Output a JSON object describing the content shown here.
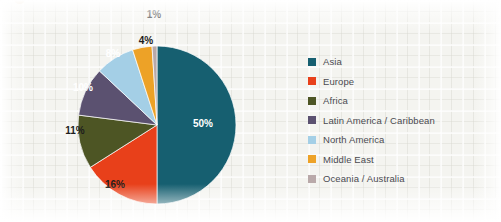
{
  "chart_data": {
    "type": "pie",
    "title": "",
    "subtitle": "",
    "xlabel": "",
    "ylabel": "",
    "legend_position": "right",
    "grid": false,
    "start_angle_deg": 0,
    "direction": "clockwise",
    "categories": [
      "Asia",
      "Europe",
      "Africa",
      "Latin America / Caribbean",
      "North America",
      "Middle East",
      "Oceania / Australia"
    ],
    "values": [
      50,
      16,
      11,
      10,
      8,
      4,
      1
    ],
    "value_unit": "%",
    "colors": [
      "#165f70",
      "#e8401a",
      "#4d5524",
      "#5b5170",
      "#a4cfe6",
      "#eda227",
      "#b9a9a9"
    ],
    "slices": [
      {
        "label": "Asia",
        "value": 50,
        "display": "50%",
        "color": "#165f70",
        "label_color": "#ffffff",
        "label_x": 203,
        "label_y": 127
      },
      {
        "label": "Europe",
        "value": 16,
        "display": "16%",
        "color": "#e8401a",
        "label_color": "#1d1d1d",
        "label_x": 115,
        "label_y": 188
      },
      {
        "label": "Africa",
        "value": 11,
        "display": "11%",
        "color": "#4d5524",
        "label_color": "#1d1d1d",
        "label_x": 75,
        "label_y": 134
      },
      {
        "label": "Latin America / Caribbean",
        "value": 10,
        "display": "10%",
        "color": "#5b5170",
        "label_color": "#ffffff",
        "label_x": 83,
        "label_y": 91
      },
      {
        "label": "North America",
        "value": 8,
        "display": "8%",
        "color": "#a4cfe6",
        "label_color": "#ffffff",
        "label_x": 113,
        "label_y": 57
      },
      {
        "label": "Middle East",
        "value": 4,
        "display": "4%",
        "color": "#eda227",
        "label_color": "#1d1d1d",
        "label_x": 146,
        "label_y": 44
      },
      {
        "label": "Oceania / Australia",
        "value": 1,
        "display": "1%",
        "color": "#b9a9a9",
        "label_color": "#1d1d1d",
        "label_x": 154,
        "label_y": 18
      }
    ],
    "geometry": {
      "center_x": 157,
      "center_y": 125,
      "radius": 79
    }
  },
  "legend": {
    "items": [
      {
        "label": "Asia",
        "color": "#165f70"
      },
      {
        "label": "Europe",
        "color": "#e8401a"
      },
      {
        "label": "Africa",
        "color": "#4d5524"
      },
      {
        "label": "Latin America / Caribbean",
        "color": "#5b5170"
      },
      {
        "label": "North America",
        "color": "#a4cfe6"
      },
      {
        "label": "Middle East",
        "color": "#eda227"
      },
      {
        "label": "Oceania / Australia",
        "color": "#b9a9a9"
      }
    ]
  }
}
